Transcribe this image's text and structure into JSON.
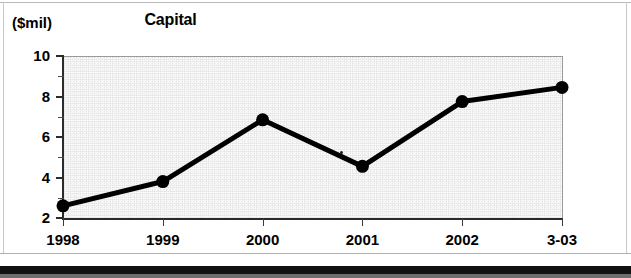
{
  "figure": {
    "title": "Capital",
    "unit_label": "($mil)"
  },
  "chart_data": {
    "type": "line",
    "title": "Capital",
    "xlabel": "",
    "ylabel": "($mil)",
    "ylim": [
      2,
      10
    ],
    "y_major_ticks": [
      2,
      4,
      6,
      8,
      10
    ],
    "y_minor_ticks": [
      3,
      5,
      7,
      9
    ],
    "grid": false,
    "legend": "none",
    "categories": [
      "1998",
      "1999",
      "2000",
      "2001",
      "2002",
      "3-03"
    ],
    "values": [
      2.6,
      3.8,
      6.85,
      4.55,
      7.75,
      8.45
    ],
    "series": [
      {
        "name": "Capital",
        "values": [
          2.6,
          3.8,
          6.85,
          4.55,
          7.75,
          8.45
        ],
        "color": "#000000",
        "marker": "filled-circle"
      }
    ]
  },
  "axis": {
    "y_tick_labels": [
      "10",
      "8",
      "6",
      "4",
      "2"
    ],
    "x_tick_labels": [
      "1998",
      "1999",
      "2000",
      "2001",
      "2002",
      "3-03"
    ]
  },
  "colors": {
    "plot_background": "#e2e2e2",
    "line": "#000000",
    "axis": "#2b2b2b",
    "page_background": "#ffffff",
    "bottom_bar": "#111111"
  }
}
